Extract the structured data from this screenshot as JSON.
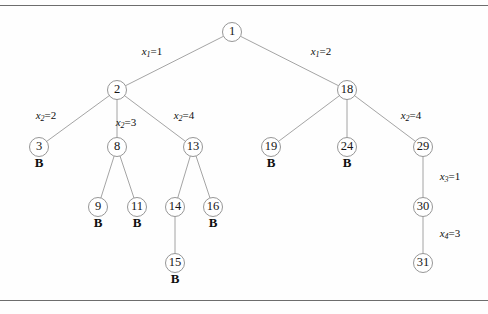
{
  "figure": {
    "type": "tree-diagram",
    "node_radius": 9.5,
    "colors": {
      "node_stroke": "#8a8a8a",
      "edge_stroke": "#9a9a9a",
      "text": "#161616",
      "rule": "#6d6d6d",
      "background": "#fefefe"
    },
    "rules": [
      {
        "name": "rule-top",
        "y": 5
      },
      {
        "name": "rule-bottom",
        "y": 300
      }
    ],
    "nodes": [
      {
        "id": "n1",
        "label": "1",
        "x": 232,
        "y": 32,
        "leaf_mark": ""
      },
      {
        "id": "n2",
        "label": "2",
        "x": 117,
        "y": 90,
        "leaf_mark": ""
      },
      {
        "id": "n18",
        "label": "18",
        "x": 347,
        "y": 90,
        "leaf_mark": ""
      },
      {
        "id": "n3",
        "label": "3",
        "x": 39,
        "y": 147,
        "leaf_mark": "B"
      },
      {
        "id": "n8",
        "label": "8",
        "x": 117,
        "y": 147,
        "leaf_mark": ""
      },
      {
        "id": "n13",
        "label": "13",
        "x": 193,
        "y": 147,
        "leaf_mark": ""
      },
      {
        "id": "n19",
        "label": "19",
        "x": 271,
        "y": 147,
        "leaf_mark": "B"
      },
      {
        "id": "n24",
        "label": "24",
        "x": 347,
        "y": 147,
        "leaf_mark": "B"
      },
      {
        "id": "n29",
        "label": "29",
        "x": 423,
        "y": 147,
        "leaf_mark": ""
      },
      {
        "id": "n9",
        "label": "9",
        "x": 98,
        "y": 207,
        "leaf_mark": "B"
      },
      {
        "id": "n11",
        "label": "11",
        "x": 137,
        "y": 207,
        "leaf_mark": "B"
      },
      {
        "id": "n14",
        "label": "14",
        "x": 175,
        "y": 207,
        "leaf_mark": ""
      },
      {
        "id": "n16",
        "label": "16",
        "x": 213,
        "y": 207,
        "leaf_mark": "B"
      },
      {
        "id": "n30",
        "label": "30",
        "x": 423,
        "y": 207,
        "leaf_mark": ""
      },
      {
        "id": "n15",
        "label": "15",
        "x": 175,
        "y": 263,
        "leaf_mark": "B"
      },
      {
        "id": "n31",
        "label": "31",
        "x": 423,
        "y": 263,
        "leaf_mark": ""
      }
    ],
    "edges": [
      {
        "id": "e1-2",
        "from": "n1",
        "to": "n2",
        "var": "x",
        "sub": "1",
        "value": "1",
        "label_x": 152,
        "label_y": 52
      },
      {
        "id": "e1-18",
        "from": "n1",
        "to": "n18",
        "var": "x",
        "sub": "1",
        "value": "2",
        "label_x": 321,
        "label_y": 52
      },
      {
        "id": "e2-3",
        "from": "n2",
        "to": "n3",
        "var": "x",
        "sub": "2",
        "value": "2",
        "label_x": 46,
        "label_y": 116
      },
      {
        "id": "e2-8",
        "from": "n2",
        "to": "n8",
        "var": "x",
        "sub": "2",
        "value": "3",
        "label_x": 126,
        "label_y": 123
      },
      {
        "id": "e2-13",
        "from": "n2",
        "to": "n13",
        "var": "x",
        "sub": "2",
        "value": "4",
        "label_x": 184,
        "label_y": 116
      },
      {
        "id": "e18-19",
        "from": "n18",
        "to": "n19",
        "var": "",
        "sub": "",
        "value": "",
        "label_x": 0,
        "label_y": 0
      },
      {
        "id": "e18-24",
        "from": "n18",
        "to": "n24",
        "var": "",
        "sub": "",
        "value": "",
        "label_x": 0,
        "label_y": 0
      },
      {
        "id": "e18-29",
        "from": "n18",
        "to": "n29",
        "var": "x",
        "sub": "2",
        "value": "4",
        "label_x": 411,
        "label_y": 116
      },
      {
        "id": "e8-9",
        "from": "n8",
        "to": "n9",
        "var": "",
        "sub": "",
        "value": "",
        "label_x": 0,
        "label_y": 0
      },
      {
        "id": "e8-11",
        "from": "n8",
        "to": "n11",
        "var": "",
        "sub": "",
        "value": "",
        "label_x": 0,
        "label_y": 0
      },
      {
        "id": "e13-14",
        "from": "n13",
        "to": "n14",
        "var": "",
        "sub": "",
        "value": "",
        "label_x": 0,
        "label_y": 0
      },
      {
        "id": "e13-16",
        "from": "n13",
        "to": "n16",
        "var": "",
        "sub": "",
        "value": "",
        "label_x": 0,
        "label_y": 0
      },
      {
        "id": "e14-15",
        "from": "n14",
        "to": "n15",
        "var": "",
        "sub": "",
        "value": "",
        "label_x": 0,
        "label_y": 0
      },
      {
        "id": "e29-30",
        "from": "n29",
        "to": "n30",
        "var": "x",
        "sub": "3",
        "value": "1",
        "label_x": 450,
        "label_y": 177
      },
      {
        "id": "e30-31",
        "from": "n30",
        "to": "n31",
        "var": "x",
        "sub": "4",
        "value": "3",
        "label_x": 450,
        "label_y": 234
      }
    ]
  }
}
